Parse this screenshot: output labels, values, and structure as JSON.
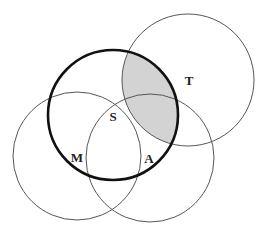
{
  "diagram": {
    "type": "venn",
    "shading_color": "#d3d3d3",
    "line_color": "#555555",
    "bold_line_color": "#111111",
    "circles": [
      {
        "id": "S",
        "label": "S",
        "cx": 113,
        "cy": 115,
        "r": 65,
        "bold": true,
        "label_x": 113,
        "label_y": 121
      },
      {
        "id": "T",
        "label": "T",
        "cx": 188,
        "cy": 80,
        "r": 66,
        "bold": false,
        "label_x": 189,
        "label_y": 85
      },
      {
        "id": "M",
        "label": "M",
        "cx": 77,
        "cy": 156,
        "r": 64,
        "bold": false,
        "label_x": 77,
        "label_y": 162
      },
      {
        "id": "A",
        "label": "A",
        "cx": 150,
        "cy": 158,
        "r": 64,
        "bold": false,
        "label_x": 149,
        "label_y": 163
      }
    ],
    "shaded_region": "S ∩ T"
  }
}
